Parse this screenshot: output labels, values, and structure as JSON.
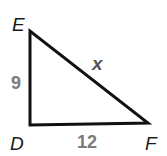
{
  "diagram": {
    "type": "right-triangle",
    "vertices": {
      "E": {
        "label": "E"
      },
      "D": {
        "label": "D"
      },
      "F": {
        "label": "F"
      }
    },
    "sides": {
      "ED": {
        "label": "9"
      },
      "DF": {
        "label": "12"
      },
      "EF": {
        "label": "x"
      }
    },
    "right_angle_at": "D",
    "colors": {
      "stroke": "#111111",
      "vertex_label": "#1a1a1a",
      "side_number": "#7a7a7a",
      "side_variable": "#555555"
    }
  }
}
